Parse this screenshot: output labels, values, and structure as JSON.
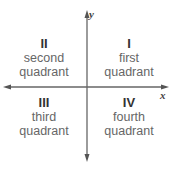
{
  "diagram": {
    "type": "coordinate-plane-quadrants",
    "axes": {
      "x_label": "x",
      "y_label": "y"
    },
    "quadrants": [
      {
        "numeral": "I",
        "name_line1": "first",
        "name_line2": "quadrant",
        "position": "top-right"
      },
      {
        "numeral": "II",
        "name_line1": "second",
        "name_line2": "quadrant",
        "position": "top-left"
      },
      {
        "numeral": "III",
        "name_line1": "third",
        "name_line2": "quadrant",
        "position": "bottom-left"
      },
      {
        "numeral": "IV",
        "name_line1": "fourth",
        "name_line2": "quadrant",
        "position": "bottom-right"
      }
    ],
    "colors": {
      "axis": "#666666",
      "numeral": "#333333",
      "text": "#666666"
    }
  }
}
